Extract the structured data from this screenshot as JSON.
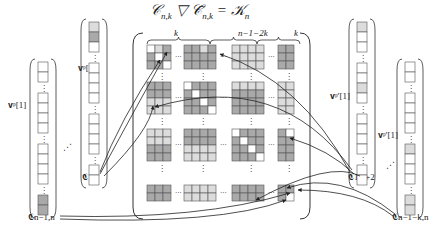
{
  "title": "𝒞n,k ▽ 𝒞̄n,k = 𝒦n",
  "title_parts": {
    "lhs1": "𝒞",
    "sub1": "n,k",
    "op": "▽",
    "lhs2": "𝒞̄",
    "sub2": "n,k",
    "eq": "=",
    "rhs": "𝒦",
    "sub3": "n"
  },
  "braces": {
    "left": "k",
    "middle": "n−1−2k",
    "right": "k"
  },
  "vectors": [
    {
      "id": "v1",
      "label": "𝐯ᵖ[1]",
      "node": "𝕮1,2"
    },
    {
      "id": "v2",
      "label": "𝐯ᵖ[1]",
      "node": "𝕮n−1,n"
    },
    {
      "id": "v3",
      "label": "𝐯ᵖ'[1]",
      "node": "𝕮1,k+2"
    },
    {
      "id": "v4",
      "label": "𝐯ᵖ'[1]",
      "node": "𝕮n−1−k,n"
    }
  ],
  "nodes": {
    "c12": "𝕮1,2",
    "cn1n": "𝕮n−1,n",
    "c1k2": "𝕮1,k+2",
    "cn1kn": "𝕮n−1−k,n"
  },
  "colors": {
    "dark": "#a9a9a9",
    "light": "#dcdcdc",
    "white": "#ffffff",
    "line": "#333333"
  },
  "ellipsis_h": "···",
  "ellipsis_v": "⋮",
  "ellipsis_d": "⋰"
}
